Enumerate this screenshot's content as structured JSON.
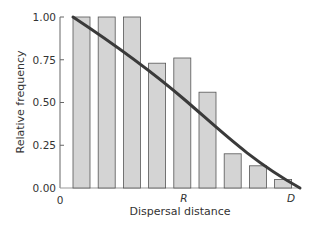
{
  "chart_data": {
    "type": "bar",
    "title": "",
    "xlabel": "Dispersal distance",
    "ylabel": "Relative frequency",
    "ylim": [
      0,
      1
    ],
    "yticks": [
      "0.00",
      "0.25",
      "0.50",
      "0.75",
      "1.00"
    ],
    "xtick_labels": {
      "origin": "0",
      "mid": "R",
      "end": "D"
    },
    "categories": [
      "1",
      "2",
      "3",
      "4",
      "5",
      "6",
      "7",
      "8",
      "9"
    ],
    "values": [
      1.0,
      1.0,
      1.0,
      0.73,
      0.76,
      0.56,
      0.2,
      0.13,
      0.05
    ],
    "overlay_curve": {
      "type": "line",
      "description": "Decreasing fitted dispersal curve from 1.00 at first bar to 0 at D",
      "points": [
        [
          0,
          1.0
        ],
        [
          0.25,
          0.82
        ],
        [
          0.5,
          0.55
        ],
        [
          0.75,
          0.24
        ],
        [
          1.0,
          0.0
        ]
      ]
    },
    "grid": false,
    "legend": null
  },
  "colors": {
    "bar_fill": "#d4d4d4",
    "bar_stroke": "#555555",
    "curve": "#3a3a3a",
    "axis": "#666666"
  }
}
